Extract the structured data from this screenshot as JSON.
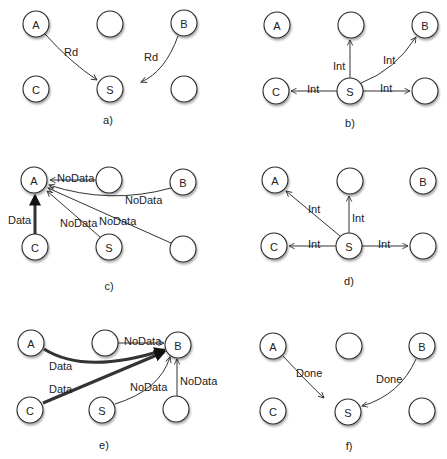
{
  "figure": {
    "colors": {
      "background": "#ffffff",
      "node_fill": "#ffffff",
      "node_stroke": "#2a2a2a",
      "edge": "#333333",
      "text": "#222222"
    },
    "node_radius": 13,
    "panels": [
      {
        "id": "a",
        "caption": "a)",
        "caption_pos": [
          108,
          124
        ],
        "nodes": [
          {
            "id": "A",
            "label": "A",
            "x": 36,
            "y": 24
          },
          {
            "id": "m1",
            "label": "",
            "x": 110,
            "y": 24
          },
          {
            "id": "B",
            "label": "B",
            "x": 184,
            "y": 23
          },
          {
            "id": "C",
            "label": "C",
            "x": 36,
            "y": 89
          },
          {
            "id": "S",
            "label": "S",
            "x": 110,
            "y": 89
          },
          {
            "id": "r1",
            "label": "",
            "x": 184,
            "y": 89
          }
        ],
        "edges": [
          {
            "from": "A",
            "to": "S",
            "label": "Rd",
            "label_pos": [
              64,
              52
            ],
            "path": "M45,34 Q70,62 97,80",
            "weight": 1
          },
          {
            "from": "B",
            "to": "S",
            "label": "Rd",
            "label_pos": [
              144,
              57
            ],
            "path": "M178,36 Q165,72 141,82",
            "weight": 1
          }
        ]
      },
      {
        "id": "b",
        "caption": "b)",
        "caption_pos": [
          350,
          127
        ],
        "nodes": [
          {
            "id": "A",
            "label": "A",
            "x": 277,
            "y": 25
          },
          {
            "id": "m1",
            "label": "",
            "x": 351,
            "y": 25
          },
          {
            "id": "B",
            "label": "B",
            "x": 425,
            "y": 25
          },
          {
            "id": "C",
            "label": "C",
            "x": 276,
            "y": 91
          },
          {
            "id": "S",
            "label": "S",
            "x": 350,
            "y": 91
          },
          {
            "id": "r1",
            "label": "",
            "x": 425,
            "y": 91
          }
        ],
        "edges": [
          {
            "from": "S",
            "to": "m1",
            "label": "Int",
            "label_pos": [
              333,
              66
            ],
            "path": "M350,78 L350,40",
            "weight": 1
          },
          {
            "from": "S",
            "to": "B",
            "label": "Int",
            "label_pos": [
              383,
              60
            ],
            "path": "M361,83 Q395,70 416,37",
            "weight": 1
          },
          {
            "from": "S",
            "to": "C",
            "label": "Int",
            "label_pos": [
              307,
              89
            ],
            "path": "M337,91 L291,91",
            "weight": 1
          },
          {
            "from": "S",
            "to": "r1",
            "label": "Int",
            "label_pos": [
              380,
              88
            ],
            "path": "M363,91 L410,91",
            "weight": 1
          }
        ]
      },
      {
        "id": "c",
        "caption": "c)",
        "caption_pos": [
          109,
          290
        ],
        "nodes": [
          {
            "id": "A",
            "label": "A",
            "x": 34,
            "y": 180
          },
          {
            "id": "m1",
            "label": "",
            "x": 109,
            "y": 180
          },
          {
            "id": "B",
            "label": "B",
            "x": 183,
            "y": 182
          },
          {
            "id": "C",
            "label": "C",
            "x": 35,
            "y": 247
          },
          {
            "id": "S",
            "label": "S",
            "x": 109,
            "y": 247
          },
          {
            "id": "r1",
            "label": "",
            "x": 183,
            "y": 249
          }
        ],
        "edges": [
          {
            "from": "C",
            "to": "A",
            "label": "Data",
            "label_pos": [
              8,
              220
            ],
            "path": "M35,234 L35,196",
            "weight": 3
          },
          {
            "from": "m1",
            "to": "A",
            "label": "NoData",
            "label_pos": [
              57,
              178
            ],
            "path": "M96,180 L50,180",
            "weight": 1
          },
          {
            "from": "B",
            "to": "A",
            "label": "NoData",
            "label_pos": [
              125,
              200
            ],
            "path": "M171,188 Q110,205 49,185",
            "weight": 1
          },
          {
            "from": "S",
            "to": "A",
            "label": "NoData",
            "label_pos": [
              60,
              223
            ],
            "path": "M100,237 L47,191",
            "weight": 1
          },
          {
            "from": "r1",
            "to": "A",
            "label": "NoData",
            "label_pos": [
              99,
              221
            ],
            "path": "M171,243 L48,188",
            "weight": 1
          }
        ]
      },
      {
        "id": "d",
        "caption": "d)",
        "caption_pos": [
          349,
          285
        ],
        "nodes": [
          {
            "id": "A",
            "label": "A",
            "x": 275,
            "y": 180
          },
          {
            "id": "m1",
            "label": "",
            "x": 350,
            "y": 181
          },
          {
            "id": "B",
            "label": "B",
            "x": 423,
            "y": 181
          },
          {
            "id": "C",
            "label": "C",
            "x": 274,
            "y": 246
          },
          {
            "id": "S",
            "label": "S",
            "x": 349,
            "y": 246
          },
          {
            "id": "r1",
            "label": "",
            "x": 423,
            "y": 246
          }
        ],
        "edges": [
          {
            "from": "S",
            "to": "A",
            "label": "Int",
            "label_pos": [
              308,
              209
            ],
            "path": "M340,236 L286,191",
            "weight": 1
          },
          {
            "from": "S",
            "to": "m1",
            "label": "Int",
            "label_pos": [
              352,
              218
            ],
            "path": "M349,233 L349,196",
            "weight": 1
          },
          {
            "from": "S",
            "to": "C",
            "label": "Int",
            "label_pos": [
              308,
              244
            ],
            "path": "M336,246 L289,246",
            "weight": 1
          },
          {
            "from": "S",
            "to": "r1",
            "label": "Int",
            "label_pos": [
              378,
              244
            ],
            "path": "M362,246 L408,246",
            "weight": 1
          }
        ]
      },
      {
        "id": "e",
        "caption": "e)",
        "caption_pos": [
          104,
          449
        ],
        "nodes": [
          {
            "id": "A",
            "label": "A",
            "x": 31,
            "y": 343
          },
          {
            "id": "m1",
            "label": "",
            "x": 105,
            "y": 343
          },
          {
            "id": "B",
            "label": "B",
            "x": 178,
            "y": 345
          },
          {
            "id": "C",
            "label": "C",
            "x": 30,
            "y": 410
          },
          {
            "id": "S",
            "label": "S",
            "x": 102,
            "y": 410
          },
          {
            "id": "r1",
            "label": "",
            "x": 176,
            "y": 409
          }
        ],
        "edges": [
          {
            "from": "A",
            "to": "B",
            "label": "Data",
            "label_pos": [
              49,
              366
            ],
            "path": "M44,349 Q85,375 164,350",
            "weight": 3
          },
          {
            "from": "C",
            "to": "B",
            "label": "Data",
            "label_pos": [
              49,
              389
            ],
            "path": "M43,403 L164,352",
            "weight": 3
          },
          {
            "from": "m1",
            "to": "B",
            "label": "NoData",
            "label_pos": [
              124,
              341
            ],
            "path": "M118,343 L164,343",
            "weight": 1
          },
          {
            "from": "S",
            "to": "B",
            "label": "NoData",
            "label_pos": [
              130,
              387
            ],
            "path": "M115,404 Q160,390 170,357",
            "weight": 1
          },
          {
            "from": "r1",
            "to": "B",
            "label": "NoData",
            "label_pos": [
              180,
              381
            ],
            "path": "M177,396 L177,359",
            "weight": 1
          }
        ]
      },
      {
        "id": "f",
        "caption": "f)",
        "caption_pos": [
          349,
          450
        ],
        "nodes": [
          {
            "id": "A",
            "label": "A",
            "x": 273,
            "y": 346
          },
          {
            "id": "m1",
            "label": "",
            "x": 349,
            "y": 346
          },
          {
            "id": "B",
            "label": "B",
            "x": 422,
            "y": 346
          },
          {
            "id": "C",
            "label": "C",
            "x": 273,
            "y": 411
          },
          {
            "id": "S",
            "label": "S",
            "x": 348,
            "y": 412
          },
          {
            "id": "r1",
            "label": "",
            "x": 422,
            "y": 411
          }
        ],
        "edges": [
          {
            "from": "A",
            "to": "S",
            "label": "Done",
            "label_pos": [
              296,
              373
            ],
            "path": "M283,356 Q310,385 324,398",
            "weight": 1
          },
          {
            "from": "B",
            "to": "S",
            "label": "Done",
            "label_pos": [
              376,
              379
            ],
            "path": "M416,359 Q400,395 362,406",
            "weight": 1
          }
        ]
      }
    ]
  }
}
